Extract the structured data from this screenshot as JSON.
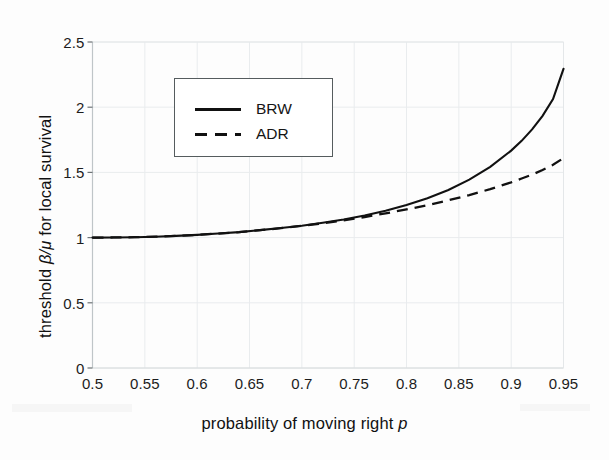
{
  "figure": {
    "background_color": "#fdfdfd",
    "line_color": "#111111",
    "axis_color": "#c8cdd0",
    "legend_border_color": "#555c5e"
  },
  "axes": {
    "x_title_prefix": "probability of moving right ",
    "x_title_symbol": "p",
    "y_title_prefix": "threshold ",
    "y_title_symbol": "β/μ",
    "y_title_suffix": " for local survival",
    "x_ticks": [
      "0.5",
      "0.55",
      "0.6",
      "0.65",
      "0.7",
      "0.75",
      "0.8",
      "0.85",
      "0.9",
      "0.95"
    ],
    "y_ticks": [
      "0",
      "0.5",
      "1",
      "1.5",
      "2",
      "2.5"
    ]
  },
  "legend": {
    "position": "upper-left-inside",
    "entries": [
      {
        "label": "BRW",
        "style": "solid"
      },
      {
        "label": "ADR",
        "style": "dashed"
      }
    ]
  },
  "chart_data": {
    "type": "line",
    "title": "",
    "xlabel": "probability of moving right p",
    "ylabel": "threshold β/μ for local survival",
    "xlim": [
      0.5,
      0.95
    ],
    "ylim": [
      0,
      2.5
    ],
    "xticks": [
      0.5,
      0.55,
      0.6,
      0.65,
      0.7,
      0.75,
      0.8,
      0.85,
      0.9,
      0.95
    ],
    "yticks": [
      0,
      0.5,
      1,
      1.5,
      2,
      2.5
    ],
    "grid": true,
    "legend_position": "upper left",
    "x": [
      0.5,
      0.52,
      0.54,
      0.56,
      0.58,
      0.6,
      0.62,
      0.64,
      0.66,
      0.68,
      0.7,
      0.72,
      0.74,
      0.76,
      0.78,
      0.8,
      0.82,
      0.84,
      0.86,
      0.88,
      0.9,
      0.91,
      0.92,
      0.93,
      0.94,
      0.95
    ],
    "series": [
      {
        "name": "BRW",
        "style": "solid",
        "values": [
          1.0,
          1.001,
          1.003,
          1.007,
          1.013,
          1.021,
          1.031,
          1.042,
          1.057,
          1.073,
          1.091,
          1.114,
          1.139,
          1.17,
          1.206,
          1.25,
          1.302,
          1.365,
          1.444,
          1.543,
          1.667,
          1.742,
          1.83,
          1.934,
          2.062,
          2.294
        ]
      },
      {
        "name": "ADR",
        "style": "dashed",
        "values": [
          1.0,
          1.001,
          1.003,
          1.007,
          1.013,
          1.021,
          1.031,
          1.042,
          1.057,
          1.072,
          1.09,
          1.11,
          1.133,
          1.158,
          1.186,
          1.216,
          1.249,
          1.286,
          1.326,
          1.372,
          1.424,
          1.453,
          1.483,
          1.518,
          1.558,
          1.61
        ]
      }
    ]
  }
}
